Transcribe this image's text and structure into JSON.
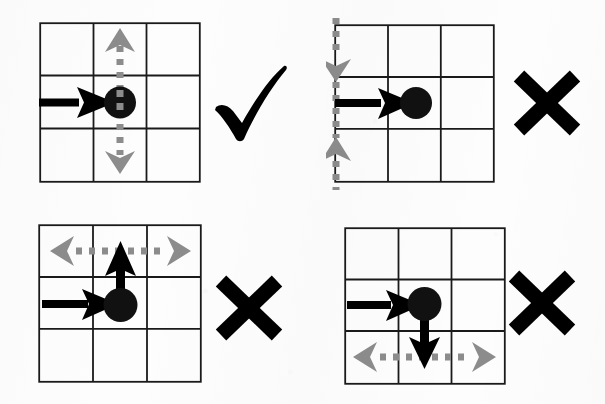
{
  "figure": {
    "title": "",
    "background_color": "#fdfdfd",
    "grid_line_color": "#1a1a1a",
    "agent_dot_color": "#111111",
    "action_arrow_color": "#000000",
    "constraint_arrow_color": "#8c8c8c",
    "check_color": "#000000",
    "cross_color": "#000000",
    "grid_rows": 3,
    "grid_cols": 3
  },
  "panels": [
    {
      "id": "panel-top-left",
      "verdict": "correct",
      "verdict_symbol": "✔",
      "verdict_label": "check",
      "agent_cell": [
        1,
        1
      ],
      "incoming_arrow": {
        "direction": "right",
        "label": "incoming-action-arrow",
        "color": "#000000"
      },
      "action_arrow": null,
      "constraint_line": {
        "orientation": "vertical",
        "label": "vertical-dashed-constraint",
        "position_desc": "center column, through agent",
        "arrow_heads": [
          "up",
          "down"
        ],
        "color": "#8c8c8c",
        "style": "dashed"
      }
    },
    {
      "id": "panel-top-right",
      "verdict": "incorrect",
      "verdict_symbol": "✖",
      "verdict_label": "cross",
      "agent_cell": [
        1,
        1
      ],
      "incoming_arrow": {
        "direction": "right",
        "label": "incoming-action-arrow",
        "color": "#000000"
      },
      "action_arrow": null,
      "constraint_line": {
        "orientation": "vertical",
        "label": "vertical-dashed-constraint",
        "position_desc": "left edge of grid",
        "arrow_heads": [
          "down",
          "up"
        ],
        "color": "#8c8c8c",
        "style": "dashed"
      }
    },
    {
      "id": "panel-bottom-left",
      "verdict": "incorrect",
      "verdict_symbol": "✖",
      "verdict_label": "cross",
      "agent_cell": [
        1,
        1
      ],
      "incoming_arrow": {
        "direction": "right",
        "label": "incoming-action-arrow",
        "color": "#000000"
      },
      "action_arrow": {
        "direction": "up",
        "label": "agent-action-arrow-up",
        "color": "#000000"
      },
      "constraint_line": {
        "orientation": "horizontal",
        "label": "horizontal-dashed-constraint",
        "position_desc": "top row",
        "arrow_heads": [
          "left",
          "right"
        ],
        "color": "#8c8c8c",
        "style": "dashed"
      }
    },
    {
      "id": "panel-bottom-right",
      "verdict": "incorrect",
      "verdict_symbol": "✖",
      "verdict_label": "cross",
      "agent_cell": [
        1,
        1
      ],
      "incoming_arrow": {
        "direction": "right",
        "label": "incoming-action-arrow",
        "color": "#000000"
      },
      "action_arrow": {
        "direction": "down",
        "label": "agent-action-arrow-down",
        "color": "#000000"
      },
      "constraint_line": {
        "orientation": "horizontal",
        "label": "horizontal-dashed-constraint",
        "position_desc": "bottom row",
        "arrow_heads": [
          "left",
          "right"
        ],
        "color": "#8c8c8c",
        "style": "dashed"
      }
    }
  ]
}
